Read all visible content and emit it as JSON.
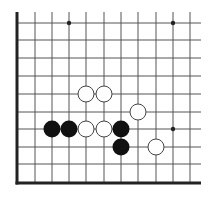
{
  "diagram": {
    "type": "go-board-fragment",
    "corner": "bottom-left",
    "colors": {
      "background": "#ffffff",
      "grid_line": "#555555",
      "edge_line": "#222222",
      "black_stone": "#111111",
      "white_stone_fill": "#ffffff",
      "white_stone_stroke": "#444444",
      "star_point": "#222222"
    },
    "grid": {
      "columns_x": [
        17,
        35,
        52,
        69,
        86,
        104,
        121,
        138,
        156,
        173,
        190
      ],
      "rows_y": [
        23,
        40,
        58,
        76,
        94,
        112,
        129,
        147,
        164,
        183
      ],
      "line_top": 12,
      "line_right": 201,
      "left_edge_x": 17,
      "bottom_edge_y": 183
    },
    "star_points": [
      {
        "col": 3,
        "row": 0
      },
      {
        "col": 9,
        "row": 0
      },
      {
        "col": 9,
        "row": 6
      }
    ],
    "stones": [
      {
        "color": "white",
        "col": 4,
        "row": 4
      },
      {
        "color": "white",
        "col": 5,
        "row": 4
      },
      {
        "color": "white",
        "col": 7,
        "row": 5
      },
      {
        "color": "black",
        "col": 2,
        "row": 6
      },
      {
        "color": "black",
        "col": 3,
        "row": 6
      },
      {
        "color": "white",
        "col": 4,
        "row": 6
      },
      {
        "color": "white",
        "col": 5,
        "row": 6
      },
      {
        "color": "black",
        "col": 6,
        "row": 6
      },
      {
        "color": "black",
        "col": 6,
        "row": 7
      },
      {
        "color": "white",
        "col": 8,
        "row": 7
      }
    ],
    "stone_radius": 8.5
  }
}
